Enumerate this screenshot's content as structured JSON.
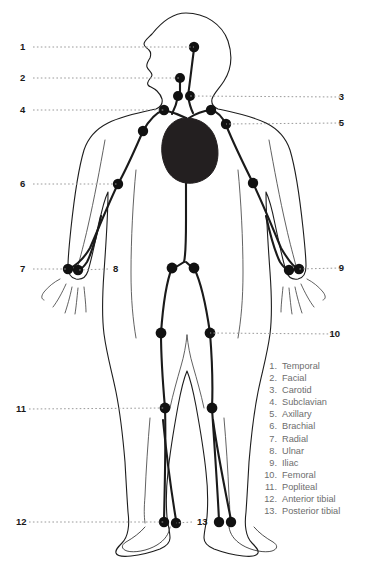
{
  "diagram": {
    "colors": {
      "outline": "#1d1d1d",
      "vessel": "#1a1a1a",
      "point_fill": "#111111",
      "heart_fill": "#231f20",
      "leader_line": "#9a9a9a",
      "number_text": "#1a1a1a",
      "legend_text": "#6d6d6d",
      "background": "#ffffff"
    }
  },
  "callouts": [
    {
      "number": "1",
      "name": "temporal",
      "side": "left",
      "x": 20,
      "y": 47,
      "dot_x": 194,
      "dot_y": 47
    },
    {
      "number": "2",
      "name": "facial",
      "side": "left",
      "x": 20,
      "y": 78,
      "dot_x": 180,
      "dot_y": 78
    },
    {
      "number": "3",
      "name": "carotid",
      "side": "right",
      "x": 344,
      "y": 97,
      "dot_x": 189,
      "dot_y": 96
    },
    {
      "number": "4",
      "name": "subclavian",
      "side": "left",
      "x": 20,
      "y": 110,
      "dot_x": 164,
      "dot_y": 110
    },
    {
      "number": "5",
      "name": "axillary",
      "side": "right",
      "x": 344,
      "y": 123,
      "dot_x": 226,
      "dot_y": 124
    },
    {
      "number": "6",
      "name": "brachial",
      "side": "left",
      "x": 20,
      "y": 184,
      "dot_x": 118,
      "dot_y": 184
    },
    {
      "number": "7",
      "name": "radial",
      "side": "left",
      "x": 20,
      "y": 269,
      "dot_x": 68,
      "dot_y": 269
    },
    {
      "number": "8",
      "name": "ulnar",
      "side": "inner",
      "x": 113,
      "y": 269,
      "dot_x": 78,
      "dot_y": 270
    },
    {
      "number": "9",
      "name": "iliac",
      "side": "right",
      "x": 344,
      "y": 268,
      "dot_x": 299,
      "dot_y": 269
    },
    {
      "number": "10",
      "name": "femoral",
      "side": "right",
      "x": 340,
      "y": 334,
      "dot_x": 210,
      "dot_y": 333
    },
    {
      "number": "11",
      "name": "popliteal",
      "side": "left",
      "x": 16,
      "y": 409,
      "dot_x": 165,
      "dot_y": 408
    },
    {
      "number": "12",
      "name": "anterior-tibial",
      "side": "left",
      "x": 16,
      "y": 522,
      "dot_x": 164,
      "dot_y": 522
    },
    {
      "number": "13",
      "name": "posterior-tibial",
      "side": "inner",
      "x": 197,
      "y": 522,
      "dot_x": 176,
      "dot_y": 523
    }
  ],
  "legend": {
    "items": [
      {
        "index": "1.",
        "label": "Temporal"
      },
      {
        "index": "2.",
        "label": "Facial"
      },
      {
        "index": "3.",
        "label": "Carotid"
      },
      {
        "index": "4.",
        "label": "Subclavian"
      },
      {
        "index": "5.",
        "label": "Axillary"
      },
      {
        "index": "6.",
        "label": "Brachial"
      },
      {
        "index": "7.",
        "label": "Radial"
      },
      {
        "index": "8.",
        "label": "Ulnar"
      },
      {
        "index": "9.",
        "label": "Iliac"
      },
      {
        "index": "10.",
        "label": "Femoral"
      },
      {
        "index": "11.",
        "label": "Popliteal"
      },
      {
        "index": "12.",
        "label": "Anterior tibial"
      },
      {
        "index": "13.",
        "label": "Posterior tibial"
      }
    ]
  },
  "pulse_points": [
    {
      "name": "temporal-point",
      "cx": 194,
      "cy": 47,
      "r": 5.2
    },
    {
      "name": "facial-point",
      "cx": 180,
      "cy": 78,
      "r": 5.0
    },
    {
      "name": "carotid-point-left",
      "cx": 178,
      "cy": 96,
      "r": 5.0
    },
    {
      "name": "carotid-point-right",
      "cx": 190,
      "cy": 96,
      "r": 5.0
    },
    {
      "name": "subclavian-point-left",
      "cx": 164,
      "cy": 110,
      "r": 5.2
    },
    {
      "name": "subclavian-point-right",
      "cx": 211,
      "cy": 110,
      "r": 5.2
    },
    {
      "name": "axillary-point-left",
      "cx": 143,
      "cy": 131,
      "r": 5.2
    },
    {
      "name": "axillary-point-right",
      "cx": 226,
      "cy": 124,
      "r": 5.2
    },
    {
      "name": "brachial-point-left",
      "cx": 118,
      "cy": 184,
      "r": 5.2
    },
    {
      "name": "brachial-point-right",
      "cx": 253,
      "cy": 183,
      "r": 5.2
    },
    {
      "name": "radial-point-left",
      "cx": 68,
      "cy": 269,
      "r": 5.2
    },
    {
      "name": "ulnar-point-left",
      "cx": 78,
      "cy": 270,
      "r": 5.2
    },
    {
      "name": "radial-point-right",
      "cx": 299,
      "cy": 269,
      "r": 5.2
    },
    {
      "name": "ulnar-point-right",
      "cx": 289,
      "cy": 270,
      "r": 5.2
    },
    {
      "name": "iliac-point-left",
      "cx": 172,
      "cy": 268,
      "r": 5.4
    },
    {
      "name": "iliac-point-right",
      "cx": 194,
      "cy": 268,
      "r": 5.4
    },
    {
      "name": "femoral-point-left",
      "cx": 161,
      "cy": 333,
      "r": 5.4
    },
    {
      "name": "femoral-point-right",
      "cx": 210,
      "cy": 333,
      "r": 5.4
    },
    {
      "name": "popliteal-point-left",
      "cx": 165,
      "cy": 408,
      "r": 5.4
    },
    {
      "name": "popliteal-point-right",
      "cx": 212,
      "cy": 408,
      "r": 5.4
    },
    {
      "name": "anterior-tibial-point-left",
      "cx": 164,
      "cy": 522,
      "r": 5.2
    },
    {
      "name": "posterior-tibial-point-left",
      "cx": 176,
      "cy": 523,
      "r": 5.2
    },
    {
      "name": "anterior-tibial-point-right",
      "cx": 219,
      "cy": 522,
      "r": 5.2
    },
    {
      "name": "posterior-tibial-point-right",
      "cx": 231,
      "cy": 522,
      "r": 5.2
    }
  ]
}
